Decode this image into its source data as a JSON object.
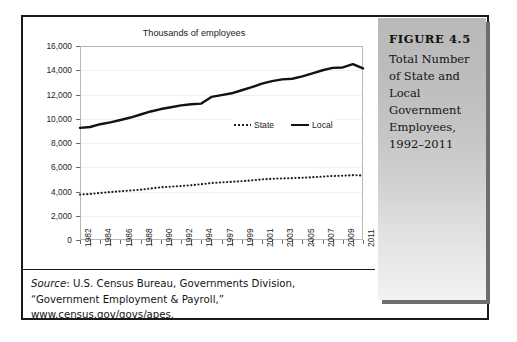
{
  "figure": {
    "caption_title": "FIGURE 4.5",
    "caption_body": "Total Number of State and Local Government Employees, 1992–2011",
    "source_label": "Source",
    "source_text": ": U.S. Census Bureau, Governments Division, “Government Employment & Payroll,” www.census.gov/govs/apes."
  },
  "colors": {
    "frame": "#1a1a1a",
    "panel_top": "#b9b9b9",
    "panel_bottom": "#f2f2f2",
    "local_line": "#121212",
    "state_line": "#222222",
    "gridline": "#f0f0f0",
    "axis": "#b7b7b7"
  },
  "chart_data": {
    "type": "line",
    "title": "Thousands of employees",
    "xlabel": "",
    "ylabel": "",
    "ylim": [
      0,
      16000
    ],
    "ytick_labels": [
      "16,000",
      "14,000",
      "12,000",
      "10,000",
      "8,000",
      "6,000",
      "4,000",
      "2,000",
      "0"
    ],
    "yticks": [
      16000,
      14000,
      12000,
      10000,
      8000,
      6000,
      4000,
      2000,
      0
    ],
    "grid": true,
    "legend_position": "inside-right",
    "categories": [
      "1982",
      "1983",
      "1984",
      "1985",
      "1986",
      "1987",
      "1988",
      "1989",
      "1990",
      "1991",
      "1992",
      "1993",
      "1994",
      "1996",
      "1997",
      "1998",
      "1999",
      "2000",
      "2001",
      "2002",
      "2003",
      "2004",
      "2005",
      "2006",
      "2007",
      "2008",
      "2009",
      "2010",
      "2011"
    ],
    "xtick_labels": [
      "1982",
      "1984",
      "1986",
      "1988",
      "1990",
      "1992",
      "1994",
      "1997",
      "1999",
      "2001",
      "2003",
      "2005",
      "2007",
      "2009",
      "2011"
    ],
    "series": [
      {
        "name": "Local",
        "style": "solid",
        "values": [
          9250,
          9320,
          9550,
          9700,
          9900,
          10100,
          10350,
          10600,
          10800,
          10950,
          11100,
          11200,
          11250,
          11800,
          11950,
          12100,
          12350,
          12600,
          12900,
          13100,
          13250,
          13300,
          13500,
          13750,
          14000,
          14200,
          14230,
          14500,
          14150
        ]
      },
      {
        "name": "State",
        "style": "dotted",
        "values": [
          3750,
          3800,
          3880,
          3960,
          4020,
          4080,
          4150,
          4250,
          4350,
          4400,
          4450,
          4520,
          4600,
          4700,
          4750,
          4800,
          4850,
          4920,
          5000,
          5050,
          5080,
          5100,
          5130,
          5180,
          5230,
          5280,
          5300,
          5350,
          5320
        ]
      }
    ]
  }
}
